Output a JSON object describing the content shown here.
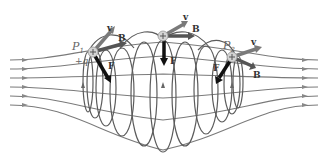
{
  "diagram": {
    "colors": {
      "field_line": "#707070",
      "loop": "#5a5a5a",
      "velocity": "#777777",
      "magnetic_field_vector": "#555555",
      "force": "#111111",
      "particle": "#cccccc"
    },
    "particles": [
      {
        "id": "p1",
        "label": "P",
        "subscript": "1",
        "charge_label": "+q",
        "sign": "+",
        "v_label": "v",
        "b_label": "B",
        "f_label": "F"
      },
      {
        "id": "top",
        "sign": "+",
        "v_label": "v",
        "b_label": "B",
        "f_label": "F"
      },
      {
        "id": "p2",
        "label": "P",
        "subscript": "2",
        "sign": "+",
        "v_label": "v",
        "b_label": "B",
        "f_label": "F"
      }
    ]
  }
}
